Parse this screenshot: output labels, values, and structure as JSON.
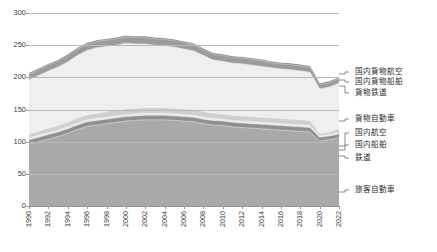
{
  "axes": {
    "y_unit_label": "Gt-CO₂",
    "y_ticks": [
      300,
      250,
      200,
      150,
      100,
      50,
      0
    ],
    "y_min": 0,
    "y_max": 300,
    "x_ticks": [
      1990,
      1992,
      1994,
      1996,
      1998,
      2000,
      2002,
      2004,
      2006,
      2008,
      2010,
      2012,
      2014,
      2016,
      2018,
      2020,
      2022
    ],
    "x_min": 1990,
    "x_max": 2022,
    "grid": true
  },
  "legend": {
    "position": "right",
    "items": [
      {
        "label": "国内貨物航空",
        "color": "#6e6e6e"
      },
      {
        "label": "国内貨物船舶",
        "color": "#9b9b9b"
      },
      {
        "label": "貨物鉄道",
        "color": "#c8c8c8"
      },
      {
        "label": "貨物自動車",
        "color": "#efefef"
      },
      {
        "label": "国内航空",
        "color": "#cfcfcf"
      },
      {
        "label": "国内船舶",
        "color": "#e8e8e8"
      },
      {
        "label": "鉄道",
        "color": "#8f8f8f"
      },
      {
        "label": "旅客自動車",
        "color": "#a9a9a9"
      }
    ]
  },
  "chart_data": {
    "type": "area",
    "title": "",
    "xlabel": "",
    "ylabel": "Gt-CO₂",
    "ylim": [
      0,
      300
    ],
    "xlim": [
      1990,
      2022
    ],
    "stacked": true,
    "stack_order_bottom_to_top": [
      "旅客自動車",
      "鉄道",
      "国内船舶",
      "国内航空",
      "貨物自動車",
      "貨物鉄道",
      "国内貨物船舶",
      "国内貨物航空"
    ],
    "x": [
      1990,
      1991,
      1992,
      1993,
      1994,
      1995,
      1996,
      1997,
      1998,
      1999,
      2000,
      2001,
      2002,
      2003,
      2004,
      2005,
      2006,
      2007,
      2008,
      2009,
      2010,
      2011,
      2012,
      2013,
      2014,
      2015,
      2016,
      2017,
      2018,
      2019,
      2020,
      2021,
      2022
    ],
    "series": [
      {
        "name": "旅客自動車",
        "color": "#a9a9a9",
        "values": [
          96,
          100,
          104,
          108,
          113,
          119,
          124,
          126,
          128,
          130,
          132,
          133,
          134,
          134,
          134,
          133,
          132,
          131,
          128,
          126,
          125,
          123,
          122,
          121,
          120,
          119,
          118,
          117,
          116,
          115,
          101,
          103,
          106
        ]
      },
      {
        "name": "鉄道",
        "color": "#8f8f8f",
        "values": [
          7,
          7,
          7,
          7,
          7,
          7,
          7,
          7,
          7,
          7,
          7,
          7,
          7,
          7,
          7,
          7,
          7,
          7,
          7,
          7,
          7,
          7,
          7,
          7,
          7,
          7,
          7,
          7,
          7,
          7,
          6,
          6,
          6
        ]
      },
      {
        "name": "国内船舶",
        "color": "#e8e8e8",
        "values": [
          3,
          3,
          3,
          3,
          3,
          3,
          3,
          3,
          3,
          3,
          3,
          3,
          3,
          3,
          3,
          3,
          3,
          3,
          3,
          3,
          3,
          3,
          3,
          3,
          3,
          3,
          3,
          3,
          3,
          3,
          2,
          2,
          2
        ]
      },
      {
        "name": "国内航空",
        "color": "#cfcfcf",
        "values": [
          6,
          6,
          7,
          7,
          7,
          8,
          8,
          8,
          9,
          9,
          9,
          9,
          9,
          9,
          9,
          9,
          9,
          9,
          9,
          8,
          8,
          8,
          8,
          8,
          8,
          8,
          8,
          8,
          8,
          8,
          4,
          4,
          6
        ]
      },
      {
        "name": "貨物自動車",
        "color": "#efefef",
        "values": [
          83,
          86,
          88,
          90,
          93,
          96,
          99,
          101,
          100,
          100,
          101,
          99,
          98,
          96,
          95,
          94,
          92,
          90,
          86,
          82,
          81,
          80,
          80,
          79,
          78,
          77,
          76,
          76,
          75,
          74,
          68,
          69,
          70
        ]
      },
      {
        "name": "貨物鉄道",
        "color": "#c8c8c8",
        "values": [
          1,
          1,
          1,
          1,
          1,
          1,
          1,
          1,
          1,
          1,
          1,
          1,
          1,
          1,
          1,
          1,
          1,
          1,
          1,
          1,
          1,
          1,
          1,
          1,
          1,
          1,
          1,
          1,
          1,
          1,
          1,
          1,
          1
        ]
      },
      {
        "name": "国内貨物船舶",
        "color": "#9b9b9b",
        "values": [
          9,
          9,
          9,
          9,
          10,
          10,
          10,
          10,
          10,
          10,
          10,
          10,
          10,
          10,
          10,
          10,
          10,
          10,
          9,
          9,
          9,
          9,
          9,
          9,
          9,
          8,
          8,
          8,
          8,
          8,
          7,
          7,
          7
        ]
      },
      {
        "name": "国内貨物航空",
        "color": "#6e6e6e",
        "values": [
          1,
          1,
          1,
          1,
          1,
          1,
          1,
          1,
          1,
          1,
          1,
          1,
          1,
          1,
          1,
          1,
          1,
          1,
          1,
          1,
          1,
          1,
          1,
          1,
          1,
          1,
          1,
          1,
          1,
          1,
          1,
          1,
          1
        ]
      }
    ],
    "totals": [
      206,
      213,
      220,
      226,
      235,
      245,
      253,
      257,
      259,
      261,
      264,
      263,
      263,
      261,
      260,
      258,
      255,
      251,
      244,
      234,
      235,
      231,
      230,
      228,
      226,
      223,
      222,
      220,
      219,
      216,
      190,
      195,
      199
    ]
  }
}
